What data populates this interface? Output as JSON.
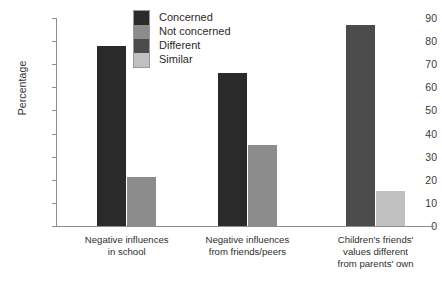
{
  "chart_data": {
    "type": "bar",
    "title": "",
    "xlabel": "",
    "ylabel": "Percentage",
    "ylim": [
      0,
      90
    ],
    "ytick_step": 10,
    "yticks": [
      90,
      80,
      70,
      60,
      50,
      40,
      30,
      20,
      10,
      0
    ],
    "grid": false,
    "legend_position": "top-center",
    "categories": [
      "Negative influences\nin school",
      "Negative influences\nfrom friends/peers",
      "Children's friends'\nvalues different\nfrom parents' own"
    ],
    "category_lines": [
      [
        "Negative influences",
        "in school"
      ],
      [
        "Negative influences",
        "from friends/peers"
      ],
      [
        "Children's friends'",
        "values different",
        "from parents' own"
      ]
    ],
    "series": [
      {
        "name": "Concerned",
        "color": "#2a2a2a",
        "values": [
          78,
          66,
          null
        ]
      },
      {
        "name": "Not concerned",
        "color": "#8c8c8c",
        "values": [
          21,
          35,
          null
        ]
      },
      {
        "name": "Different",
        "color": "#4b4b4b",
        "values": [
          null,
          null,
          87
        ]
      },
      {
        "name": "Similar",
        "color": "#c0c0c0",
        "values": [
          null,
          null,
          15
        ]
      }
    ],
    "bars": [
      {
        "group": 0,
        "series": "Concerned",
        "value": 78,
        "color": "#2a2a2a"
      },
      {
        "group": 0,
        "series": "Not concerned",
        "value": 21,
        "color": "#8c8c8c"
      },
      {
        "group": 1,
        "series": "Concerned",
        "value": 66,
        "color": "#2a2a2a"
      },
      {
        "group": 1,
        "series": "Not concerned",
        "value": 35,
        "color": "#8c8c8c"
      },
      {
        "group": 2,
        "series": "Different",
        "value": 87,
        "color": "#4b4b4b"
      },
      {
        "group": 2,
        "series": "Similar",
        "value": 15,
        "color": "#c0c0c0"
      }
    ],
    "legend": [
      {
        "label": "Concerned",
        "color": "#2a2a2a"
      },
      {
        "label": "Not concerned",
        "color": "#8c8c8c"
      },
      {
        "label": "Different",
        "color": "#4b4b4b"
      },
      {
        "label": "Similar",
        "color": "#c0c0c0"
      }
    ]
  },
  "axis": {
    "y_title": "Percentage",
    "y_labels": [
      "90",
      "80",
      "70",
      "60",
      "50",
      "40",
      "30",
      "20",
      "10",
      "0"
    ]
  },
  "colors": {
    "axis_line": "#8d8d8d",
    "text": "#2b2b2b",
    "background": "#ffffff"
  }
}
